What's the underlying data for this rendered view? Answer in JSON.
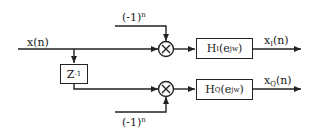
{
  "diagram": {
    "type": "block-diagram",
    "input": {
      "label": "x(n)",
      "base": "x",
      "arg": "(n)"
    },
    "delay": {
      "label": "Z^-1",
      "base": "Z",
      "sup": "-1"
    },
    "modulator_top": {
      "label": "(-1)^n",
      "base": "(-1)",
      "sup": "n"
    },
    "modulator_bottom": {
      "label": "(-1)^n",
      "base": "(-1)",
      "sup": "n"
    },
    "multiplier_symbol": "×",
    "filter_I": {
      "label": "H_I(e^jw)",
      "base": "H",
      "sub": "I",
      "open": "(e",
      "sup": "jw",
      "close": ")"
    },
    "filter_Q": {
      "label": "H_Q(e^jw)",
      "base": "H",
      "sub": "Q",
      "open": "(e",
      "sup": "jw",
      "close": ")"
    },
    "output_I": {
      "label": "x_I(n)",
      "base": "x",
      "sub": "I",
      "arg": "(n)"
    },
    "output_Q": {
      "label": "x_Q(n)",
      "base": "x",
      "sub": "Q",
      "arg": "(n)"
    },
    "colors": {
      "line": "#222222",
      "background": "#ffffff"
    }
  }
}
